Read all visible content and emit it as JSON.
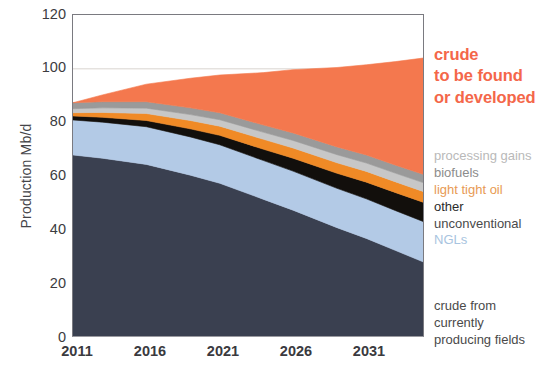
{
  "chart_data": {
    "type": "area",
    "stacked": true,
    "title": "",
    "xlabel": "",
    "ylabel": "Production Mb/d",
    "xlim": [
      2011,
      2035
    ],
    "ylim": [
      0,
      120
    ],
    "yticks": [
      0,
      20,
      40,
      60,
      80,
      100,
      120
    ],
    "xticks": [
      2011,
      2016,
      2021,
      2026,
      2031
    ],
    "grid": "horizontal-at-100-only",
    "legend_position": "right",
    "x": [
      2011,
      2013,
      2016,
      2019,
      2021,
      2024,
      2026,
      2029,
      2031,
      2033,
      2035
    ],
    "series": [
      {
        "name": "crude from currently producing fields",
        "color": "#3A4050",
        "values": [
          68.0,
          66.8,
          64.5,
          60.5,
          57.5,
          51.5,
          47.5,
          41.0,
          37.0,
          32.5,
          28.0
        ]
      },
      {
        "name": "NGLs",
        "color": "#B3CAE6",
        "values": [
          13.0,
          13.4,
          14.0,
          14.2,
          14.3,
          14.4,
          14.5,
          14.6,
          14.7,
          14.8,
          15.0
        ]
      },
      {
        "name": "other unconventional",
        "color": "#120F0C",
        "values": [
          1.5,
          1.8,
          2.3,
          3.0,
          3.5,
          4.2,
          4.8,
          5.6,
          6.2,
          6.7,
          7.2
        ]
      },
      {
        "name": "light tight oil",
        "color": "#F08A26",
        "values": [
          1.2,
          1.8,
          2.6,
          3.1,
          3.4,
          3.7,
          3.8,
          3.9,
          4.0,
          4.0,
          4.0
        ]
      },
      {
        "name": "biofuels",
        "color": "#C7C7C7",
        "values": [
          1.5,
          1.7,
          2.0,
          2.2,
          2.4,
          2.6,
          2.8,
          3.0,
          3.1,
          3.2,
          3.3
        ]
      },
      {
        "name": "processing gains",
        "color": "#9A9A9A",
        "values": [
          2.2,
          2.3,
          2.4,
          2.5,
          2.6,
          2.7,
          2.8,
          2.9,
          3.0,
          3.0,
          3.1
        ]
      },
      {
        "name": "crude to be found or developed",
        "color": "#F4784E",
        "values": [
          0.0,
          2.5,
          6.5,
          11.0,
          14.0,
          19.5,
          23.5,
          29.5,
          33.5,
          38.5,
          43.5
        ]
      }
    ]
  },
  "axes": {
    "ylabel": "Production Mb/d",
    "ytick_labels": [
      "0",
      "20",
      "40",
      "60",
      "80",
      "100",
      "120"
    ],
    "xtick_labels": [
      "2011",
      "2016",
      "2021",
      "2026",
      "2031"
    ]
  },
  "legend": {
    "headline": {
      "line1": "crude",
      "line2": "to be found",
      "line3": "or developed",
      "color": "#F4674A"
    },
    "items": [
      {
        "label": "processing gains",
        "color": "#B9B9B9"
      },
      {
        "label": "biofuels",
        "color": "#8C8C8C"
      },
      {
        "label": "light tight oil",
        "color": "#E89A54"
      },
      {
        "label": "other",
        "color": "#2B2B2B"
      },
      {
        "label": "unconventional",
        "color": "#4A4A4A"
      },
      {
        "label": "NGLs",
        "color": "#A8C4E0"
      }
    ],
    "footer": {
      "line1": "crude from",
      "line2": "currently",
      "line3": "producing fields",
      "color": "#4A4A4A"
    }
  }
}
